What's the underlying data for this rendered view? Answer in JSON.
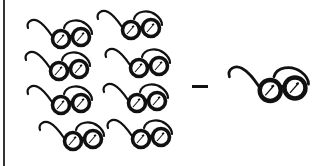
{
  "figure": {
    "operator": "minus",
    "left_group": {
      "item": "glasses",
      "count": 8,
      "positions": [
        {
          "x": 24,
          "y": 16
        },
        {
          "x": 94,
          "y": 7
        },
        {
          "x": 22,
          "y": 48
        },
        {
          "x": 102,
          "y": 45
        },
        {
          "x": 24,
          "y": 82
        },
        {
          "x": 100,
          "y": 80
        },
        {
          "x": 36,
          "y": 118
        },
        {
          "x": 104,
          "y": 116
        }
      ]
    },
    "right_group": {
      "item": "glasses",
      "count": 1,
      "positions": [
        {
          "x": 224,
          "y": 62
        }
      ]
    },
    "colors": {
      "ink": "#111111",
      "background": "#ffffff",
      "border": "#333333"
    }
  }
}
